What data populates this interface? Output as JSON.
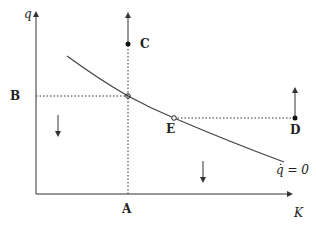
{
  "diagram": {
    "axes": {
      "y_label": "q",
      "x_label": "K"
    },
    "curve": {
      "label": "q̇ = 0",
      "description": "downward-sloping q-dot = 0 locus"
    },
    "points": {
      "A": "A",
      "B": "B",
      "C": "C",
      "D": "D",
      "E": "E"
    },
    "arrows": [
      {
        "name": "arrow-up-from-C",
        "direction": "up"
      },
      {
        "name": "arrow-up-from-D",
        "direction": "up"
      },
      {
        "name": "arrow-down-left-region",
        "direction": "down"
      },
      {
        "name": "arrow-down-right-region",
        "direction": "down"
      }
    ],
    "colors": {
      "line": "#333333",
      "background": "#ffffff"
    }
  }
}
